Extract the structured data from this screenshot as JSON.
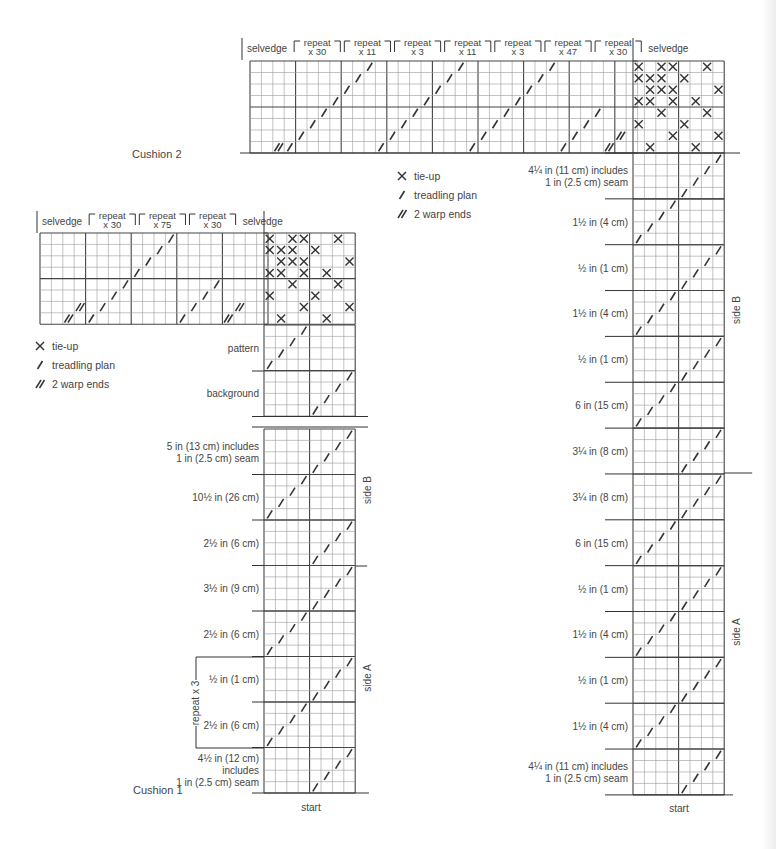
{
  "colors": {
    "ink": "#333333",
    "grid_thin": "#9a9a9a",
    "grid_thick": "#444444",
    "text": "#444444"
  },
  "legend_items": [
    {
      "symbol": "tie-up-x",
      "label": "tie-up"
    },
    {
      "symbol": "slash",
      "label": "treadling plan"
    },
    {
      "symbol": "double-slash",
      "label": "2 warp ends"
    }
  ],
  "cushion2": {
    "title": "Cushion 2",
    "threading_headers": [
      {
        "top": "selvedge",
        "bottom": "",
        "cells": 4
      },
      {
        "top": "repeat",
        "bottom": "x 30",
        "cells": 4
      },
      {
        "top": "repeat",
        "bottom": "x 11",
        "cells": 4
      },
      {
        "top": "repeat",
        "bottom": "x 3",
        "cells": 4
      },
      {
        "top": "repeat",
        "bottom": "x 11",
        "cells": 4
      },
      {
        "top": "repeat",
        "bottom": "x 3",
        "cells": 4
      },
      {
        "top": "repeat",
        "bottom": "x 47",
        "cells": 4
      },
      {
        "top": "repeat",
        "bottom": "x 30",
        "cells": 4
      },
      {
        "top": "selvedge",
        "bottom": "",
        "cells": 4
      }
    ],
    "side_labels": {
      "upper": "side B",
      "lower": "side A"
    },
    "start_label": "start",
    "sections": [
      {
        "label": [
          "4¼ in (11 cm) includes",
          "1 in (2.5 cm) seam"
        ],
        "dir": "right"
      },
      {
        "label": [
          "1½ in (4 cm)"
        ],
        "dir": "left"
      },
      {
        "label": [
          "½ in (1 cm)"
        ],
        "dir": "right"
      },
      {
        "label": [
          "1½ in (4 cm)"
        ],
        "dir": "left"
      },
      {
        "label": [
          "½ in (1 cm)"
        ],
        "dir": "right"
      },
      {
        "label": [
          "6 in (15 cm)"
        ],
        "dir": "left"
      },
      {
        "label": [
          "3¼ in (8 cm)"
        ],
        "dir": "right"
      },
      {
        "label": [
          "3¼ in (8 cm)"
        ],
        "dir": "right"
      },
      {
        "label": [
          "6 in (15 cm)"
        ],
        "dir": "left"
      },
      {
        "label": [
          "½ in (1 cm)"
        ],
        "dir": "right"
      },
      {
        "label": [
          "1½ in (4 cm)"
        ],
        "dir": "left"
      },
      {
        "label": [
          "½ in (1 cm)"
        ],
        "dir": "right"
      },
      {
        "label": [
          "1½ in (4 cm)"
        ],
        "dir": "left"
      },
      {
        "label": [
          "4¼ in (11 cm) includes",
          "1 in (2.5 cm) seam"
        ],
        "dir": "right-start"
      }
    ]
  },
  "cushion1": {
    "title": "Cushion 1",
    "threading_headers": [
      {
        "top": "selvedge",
        "bottom": "",
        "cells": 4
      },
      {
        "top": "repeat",
        "bottom": "x 30",
        "cells": 4
      },
      {
        "top": "repeat",
        "bottom": "x 75",
        "cells": 4
      },
      {
        "top": "repeat",
        "bottom": "x 30",
        "cells": 4
      },
      {
        "top": "selvedge",
        "bottom": "",
        "cells": 4
      }
    ],
    "treadling_keys": [
      {
        "label": "pattern",
        "dir": "left"
      },
      {
        "label": "background",
        "dir": "right"
      }
    ],
    "side_labels": {
      "upper": "side B",
      "lower": "side A"
    },
    "repeat_bracket_label": "repeat x 3",
    "start_label": "start",
    "sections": [
      {
        "label": [
          "5 in (13 cm) includes",
          "1 in (2.5 cm) seam"
        ],
        "dir": "right"
      },
      {
        "label": [
          "10½ in (26 cm)"
        ],
        "dir": "left"
      },
      {
        "label": [
          "2½ in (6 cm)"
        ],
        "dir": "right"
      },
      {
        "label": [
          "3½ in (9 cm)"
        ],
        "dir": "right"
      },
      {
        "label": [
          "2½ in (6 cm)"
        ],
        "dir": "left"
      },
      {
        "label": [
          "½ in (1 cm)"
        ],
        "dir": "right"
      },
      {
        "label": [
          "2½ in (6 cm)"
        ],
        "dir": "left"
      },
      {
        "label": [
          "4½ in (12 cm)",
          "includes",
          "1 in (2.5 cm) seam"
        ],
        "dir": "right-start"
      }
    ]
  },
  "tie_up": [
    [
      1,
      0,
      1,
      1,
      0,
      0,
      1,
      0
    ],
    [
      1,
      1,
      1,
      0,
      1,
      0,
      0,
      0
    ],
    [
      0,
      1,
      1,
      1,
      0,
      0,
      0,
      1
    ],
    [
      1,
      1,
      0,
      1,
      0,
      1,
      0,
      0
    ],
    [
      0,
      0,
      1,
      0,
      0,
      0,
      1,
      0
    ],
    [
      1,
      0,
      0,
      0,
      1,
      0,
      0,
      0
    ],
    [
      0,
      0,
      0,
      1,
      0,
      0,
      0,
      1
    ],
    [
      0,
      1,
      0,
      0,
      0,
      1,
      0,
      0
    ]
  ]
}
